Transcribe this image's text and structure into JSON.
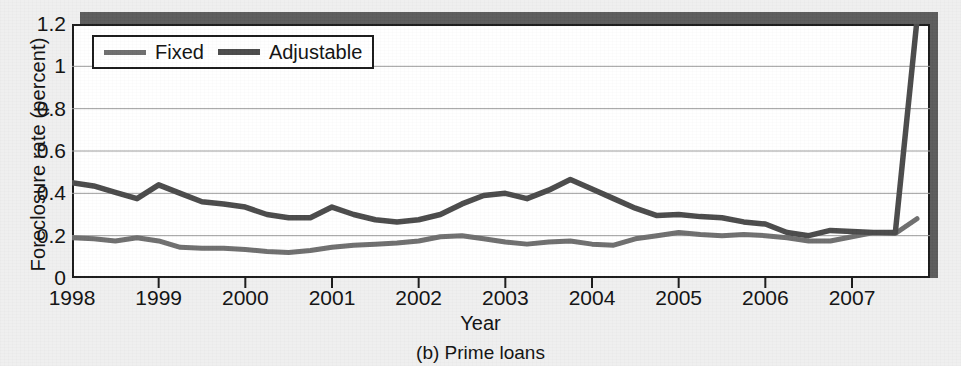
{
  "figure": {
    "caption": "(b) Prime loans",
    "background_color": "#efefef",
    "plot_background_color": "#ffffff",
    "frame_color": "#1a1a1a",
    "shadow_color": "#5b5b5b",
    "gridline_color": "#9a9a9a"
  },
  "legend": {
    "position": "top-left-inside",
    "entries": [
      {
        "label": "Fixed",
        "color": "#6e6e6e"
      },
      {
        "label": "Adjustable",
        "color": "#4a4a4a"
      }
    ]
  },
  "chart_data": {
    "type": "line",
    "title": "",
    "subtitle": "",
    "caption": "(b) Prime loans",
    "xlabel": "Year",
    "ylabel": "Foreclosure rate (percent)",
    "xlim": [
      1998.0,
      2007.9
    ],
    "ylim": [
      0,
      1.2
    ],
    "grid": true,
    "grid_axis": "y",
    "legend_position": "top-left-inside",
    "ytick_labels": [
      "1.2",
      "1",
      "0.8",
      "0.6",
      "0.4",
      "0.2",
      "0"
    ],
    "ytick_values": [
      1.2,
      1.0,
      0.8,
      0.6,
      0.4,
      0.2,
      0.0
    ],
    "xtick_labels": [
      "1998",
      "1999",
      "2000",
      "2001",
      "2002",
      "2003",
      "2004",
      "2005",
      "2006",
      "2007"
    ],
    "xtick_values": [
      1998,
      1999,
      2000,
      2001,
      2002,
      2003,
      2004,
      2005,
      2006,
      2007
    ],
    "x": [
      1998.0,
      1998.25,
      1998.5,
      1998.75,
      1999.0,
      1999.25,
      1999.5,
      1999.75,
      2000.0,
      2000.25,
      2000.5,
      2000.75,
      2001.0,
      2001.25,
      2001.5,
      2001.75,
      2002.0,
      2002.25,
      2002.5,
      2002.75,
      2003.0,
      2003.25,
      2003.5,
      2003.75,
      2004.0,
      2004.25,
      2004.5,
      2004.75,
      2005.0,
      2005.25,
      2005.5,
      2005.75,
      2006.0,
      2006.25,
      2006.5,
      2006.75,
      2007.0,
      2007.25,
      2007.5,
      2007.75
    ],
    "series": [
      {
        "name": "Fixed",
        "color": "#6e6e6e",
        "values": [
          0.19,
          0.185,
          0.175,
          0.19,
          0.175,
          0.145,
          0.14,
          0.14,
          0.135,
          0.125,
          0.12,
          0.13,
          0.145,
          0.155,
          0.16,
          0.165,
          0.175,
          0.195,
          0.2,
          0.185,
          0.17,
          0.16,
          0.17,
          0.175,
          0.16,
          0.155,
          0.185,
          0.2,
          0.215,
          0.205,
          0.2,
          0.205,
          0.2,
          0.19,
          0.175,
          0.175,
          0.195,
          0.215,
          0.21,
          0.21
        ]
      },
      {
        "name": "Adjustable",
        "color": "#4a4a4a",
        "values": [
          0.45,
          0.435,
          0.405,
          0.375,
          0.44,
          0.4,
          0.36,
          0.35,
          0.335,
          0.3,
          0.285,
          0.285,
          0.335,
          0.3,
          0.275,
          0.265,
          0.275,
          0.3,
          0.35,
          0.39,
          0.4,
          0.375,
          0.415,
          0.465,
          0.42,
          0.375,
          0.33,
          0.295,
          0.3,
          0.29,
          0.285,
          0.265,
          0.255,
          0.215,
          0.2,
          0.225,
          0.22,
          0.215,
          0.215,
          0.225
        ]
      }
    ],
    "series_tail_note": {
      "Adjustable_end_value": 1.22,
      "Fixed_end_value": 0.28
    }
  }
}
